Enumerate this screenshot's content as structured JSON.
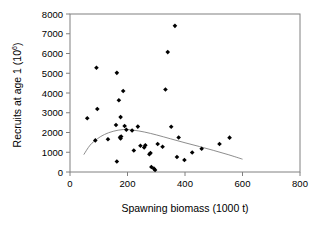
{
  "chart_data": {
    "type": "scatter",
    "title": "",
    "xlabel": "Spawning biomass (1000 t)",
    "ylabel_main": "Recruits at age 1 (10",
    "ylabel_sup": "6",
    "ylabel_close": ")",
    "xlim": [
      0,
      800
    ],
    "ylim": [
      0,
      8000
    ],
    "xticks": [
      0,
      200,
      400,
      600,
      800
    ],
    "yticks": [
      0,
      1000,
      2000,
      3000,
      4000,
      5000,
      6000,
      7000,
      8000
    ],
    "xtick_labels": [
      "0",
      "200",
      "400",
      "600",
      "800"
    ],
    "ytick_labels": [
      "0",
      "1000",
      "2000",
      "3000",
      "4000",
      "5000",
      "6000",
      "7000",
      "8000"
    ],
    "grid": false,
    "legend": "none",
    "marker": "diamond",
    "marker_color": "#000000",
    "curve_color": "#808080",
    "axis_color": "#808080",
    "points": [
      [
        60,
        2720
      ],
      [
        92,
        5280
      ],
      [
        95,
        3190
      ],
      [
        88,
        1600
      ],
      [
        132,
        1660
      ],
      [
        160,
        2380
      ],
      [
        163,
        5020
      ],
      [
        163,
        530
      ],
      [
        170,
        3630
      ],
      [
        174,
        1760
      ],
      [
        176,
        1700
      ],
      [
        178,
        1800
      ],
      [
        185,
        4100
      ],
      [
        176,
        2780
      ],
      [
        190,
        2330
      ],
      [
        196,
        2140
      ],
      [
        216,
        2100
      ],
      [
        222,
        1090
      ],
      [
        236,
        2300
      ],
      [
        245,
        1330
      ],
      [
        258,
        1240
      ],
      [
        262,
        1350
      ],
      [
        276,
        900
      ],
      [
        280,
        960
      ],
      [
        283,
        250
      ],
      [
        292,
        170
      ],
      [
        296,
        100
      ],
      [
        305,
        1420
      ],
      [
        322,
        1280
      ],
      [
        332,
        4180
      ],
      [
        340,
        6070
      ],
      [
        352,
        2290
      ],
      [
        365,
        7400
      ],
      [
        372,
        760
      ],
      [
        378,
        1750
      ],
      [
        398,
        610
      ],
      [
        425,
        990
      ],
      [
        458,
        1180
      ],
      [
        520,
        1420
      ],
      [
        555,
        1740
      ]
    ],
    "curve": {
      "description": "Ricker-type stock-recruitment fit",
      "points": [
        [
          48,
          880
        ],
        [
          70,
          1360
        ],
        [
          95,
          1680
        ],
        [
          120,
          1900
        ],
        [
          150,
          2060
        ],
        [
          185,
          2150
        ],
        [
          220,
          2120
        ],
        [
          260,
          2020
        ],
        [
          300,
          1880
        ],
        [
          350,
          1680
        ],
        [
          400,
          1480
        ],
        [
          450,
          1290
        ],
        [
          500,
          1090
        ],
        [
          550,
          880
        ],
        [
          600,
          650
        ]
      ]
    }
  }
}
